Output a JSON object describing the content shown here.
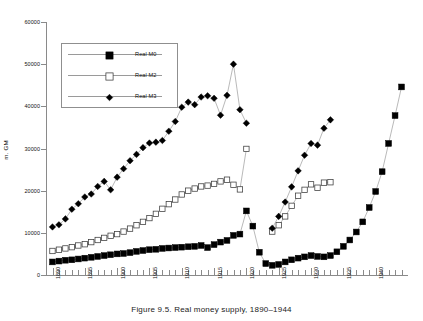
{
  "caption": "Figure 9.5. Real money supply, 1890–1944",
  "axes": {
    "ylabel": "m. GM",
    "yticks": [
      0,
      10000,
      20000,
      30000,
      40000,
      50000,
      60000
    ],
    "ytick_labels": [
      "0",
      "10000",
      "20000",
      "30000",
      "40000",
      "50000",
      "60000"
    ],
    "ylim": [
      0,
      60000
    ],
    "xlim": [
      1889,
      1945
    ],
    "xtick_labels": [
      "1890",
      "1895",
      "1900",
      "1905",
      "1910",
      "1915",
      "1920",
      "1925",
      "1930",
      "1935",
      "1940"
    ],
    "xtick_values": [
      1890,
      1895,
      1900,
      1905,
      1910,
      1915,
      1920,
      1925,
      1930,
      1935,
      1940
    ],
    "xminor_step": 1,
    "grid": false
  },
  "legend": {
    "position": "upper-left-inside",
    "entries": [
      {
        "label": "Real M0",
        "marker": "filled-square",
        "color": "#000000"
      },
      {
        "label": "Real M2",
        "marker": "open-square",
        "color": "#000000"
      },
      {
        "label": "Real M3",
        "marker": "filled-diamond",
        "color": "#000000"
      }
    ]
  },
  "chart_data": {
    "type": "line",
    "title": "",
    "subtitle": "",
    "xlabel": "",
    "ylabel": "m. GM",
    "ylim": [
      0,
      60000
    ],
    "xlim": [
      1889,
      1945
    ],
    "grid": false,
    "legend_position": "upper-left-inside",
    "series": [
      {
        "name": "Real M0",
        "marker": "filled-square",
        "color": "#000000",
        "x": [
          1890,
          1891,
          1892,
          1893,
          1894,
          1895,
          1896,
          1897,
          1898,
          1899,
          1900,
          1901,
          1902,
          1903,
          1904,
          1905,
          1906,
          1907,
          1908,
          1909,
          1910,
          1911,
          1912,
          1913,
          1914,
          1915,
          1916,
          1917,
          1918,
          1919,
          1920,
          1921,
          1922,
          1923,
          1924,
          1925,
          1926,
          1927,
          1928,
          1929,
          1930,
          1931,
          1932,
          1933,
          1934,
          1935,
          1936,
          1937,
          1938,
          1939,
          1940,
          1941,
          1942,
          1943,
          1944
        ],
        "y": [
          3100,
          3300,
          3500,
          3600,
          3800,
          4000,
          4200,
          4400,
          4600,
          4800,
          5000,
          5100,
          5300,
          5600,
          5800,
          6000,
          6100,
          6300,
          6400,
          6500,
          6600,
          6700,
          6800,
          7000,
          6500,
          7200,
          7800,
          8200,
          9400,
          9700,
          15200,
          11600,
          5400,
          2700,
          2300,
          2500,
          3100,
          3600,
          4000,
          4300,
          4600,
          4400,
          4300,
          4600,
          5500,
          6800,
          8300,
          10200,
          12600,
          16000,
          19800,
          24500,
          31200,
          37800,
          44600
        ]
      },
      {
        "name": "Real M2",
        "marker": "open-square",
        "color": "#000000",
        "x": [
          1890,
          1891,
          1892,
          1893,
          1894,
          1895,
          1896,
          1897,
          1898,
          1899,
          1900,
          1901,
          1902,
          1903,
          1904,
          1905,
          1906,
          1907,
          1908,
          1909,
          1910,
          1911,
          1912,
          1913,
          1914,
          1915,
          1916,
          1917,
          1918,
          1919,
          1920,
          1924,
          1925,
          1926,
          1927,
          1928,
          1929,
          1930,
          1931,
          1932,
          1933
        ],
        "y": [
          5700,
          6000,
          6300,
          6600,
          7000,
          7300,
          7800,
          8300,
          8800,
          9300,
          9700,
          10300,
          11000,
          11800,
          12600,
          13500,
          14500,
          15700,
          16800,
          17900,
          19100,
          20000,
          20500,
          21000,
          21200,
          21600,
          22200,
          22600,
          21400,
          20300,
          29900,
          10300,
          11800,
          13900,
          16400,
          18800,
          20200,
          21500,
          20700,
          21900,
          22000
        ]
      },
      {
        "name": "Real M3",
        "marker": "filled-diamond",
        "color": "#000000",
        "x": [
          1890,
          1891,
          1892,
          1893,
          1894,
          1895,
          1896,
          1897,
          1898,
          1899,
          1900,
          1901,
          1902,
          1903,
          1904,
          1905,
          1906,
          1907,
          1908,
          1909,
          1910,
          1911,
          1912,
          1913,
          1914,
          1915,
          1916,
          1917,
          1918,
          1919,
          1920,
          1924,
          1925,
          1926,
          1927,
          1928,
          1929,
          1930,
          1931,
          1932,
          1933
        ],
        "y": [
          11400,
          11900,
          13300,
          15600,
          16900,
          18500,
          19200,
          21000,
          22200,
          20200,
          23200,
          25200,
          27100,
          28600,
          30200,
          31300,
          31500,
          31900,
          34100,
          36400,
          39800,
          41000,
          40400,
          42200,
          42500,
          41900,
          37900,
          42600,
          50000,
          39200,
          36000,
          11100,
          13900,
          17300,
          20900,
          24700,
          28400,
          31200,
          30800,
          34800,
          36800
        ]
      }
    ]
  }
}
